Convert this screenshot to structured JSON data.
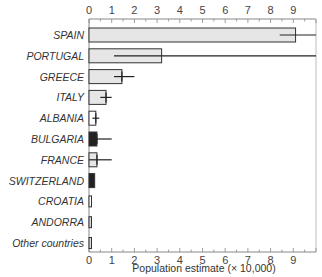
{
  "chart_data": {
    "type": "bar",
    "orientation": "horizontal",
    "title": "",
    "xlabel": "Population estimate (× 10,000)",
    "ylabel": "",
    "xlim": [
      0,
      10
    ],
    "x_ticks": [
      0,
      1,
      2,
      3,
      4,
      5,
      6,
      7,
      8,
      9
    ],
    "grid": false,
    "legend": null,
    "categories": [
      "SPAIN",
      "PORTUGAL",
      "GREECE",
      "ITALY",
      "ALBANIA",
      "BULGARIA",
      "FRANCE",
      "SWITZERLAND",
      "CROATIA",
      "ANDORRA",
      "Other countries"
    ],
    "values": [
      9.1,
      3.2,
      1.45,
      0.75,
      0.3,
      0.35,
      0.35,
      0.25,
      0.1,
      0.1,
      0.07
    ],
    "error_low": [
      8.4,
      1.1,
      1.1,
      0.5,
      0.15,
      0.0,
      0.0,
      null,
      null,
      null,
      null
    ],
    "error_high": [
      10.5,
      10.5,
      2.0,
      1.0,
      0.45,
      1.0,
      1.0,
      null,
      null,
      null,
      null
    ],
    "fills": [
      "#e6e6e6",
      "#e6e6e6",
      "#e6e6e6",
      "#e6e6e6",
      "#ffffff",
      "#222222",
      "#e6e6e6",
      "#222222",
      "#ffffff",
      "#d8d8d8",
      "#d8d8d8"
    ]
  }
}
